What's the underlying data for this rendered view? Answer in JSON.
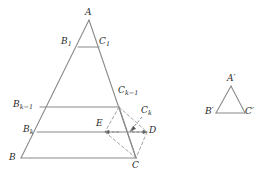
{
  "figure": {
    "background_color": "#ffffff",
    "line_color": "#8a8a8a",
    "dash_color": "#9a9a9a",
    "label_color": "#2b2b2b",
    "labels": {
      "A": "A",
      "B": "B",
      "C": "C",
      "B1_base": "B",
      "B1_sub": "1",
      "C1_base": "C",
      "C1_sub": "1",
      "Bk1_base": "B",
      "Bk1_sub": "k−1",
      "Ck1_base": "C",
      "Ck1_sub": "k−1",
      "Bk_base": "B",
      "Bk_sub": "k",
      "Ck_base": "C",
      "Ck_sub": "k",
      "D": "D",
      "E": "E",
      "Ap": "A′",
      "Bp": "B′",
      "Cp": "C′"
    },
    "points": {
      "A": {
        "x": 89,
        "y": 20
      },
      "B": {
        "x": 21,
        "y": 158
      },
      "C": {
        "x": 136,
        "y": 158
      },
      "B1": {
        "x": 78,
        "y": 47
      },
      "C1": {
        "x": 99,
        "y": 47
      },
      "Bk1": {
        "x": 40,
        "y": 107
      },
      "Ck1": {
        "x": 119,
        "y": 107
      },
      "Bk": {
        "x": 37,
        "y": 132
      },
      "Ck": {
        "x": 130,
        "y": 132
      },
      "E": {
        "x": 105,
        "y": 132
      },
      "D": {
        "x": 147,
        "y": 132
      },
      "Ap": {
        "x": 231,
        "y": 86
      },
      "Bp": {
        "x": 216,
        "y": 113
      },
      "Cp": {
        "x": 245,
        "y": 113
      }
    },
    "solid_segments": [
      {
        "name": "side-AB",
        "from": "A",
        "to": "B"
      },
      {
        "name": "side-AC",
        "from": "A",
        "to": "C"
      },
      {
        "name": "base-BC",
        "from": "B",
        "to": "C"
      },
      {
        "name": "line-B1C1",
        "from": "B1",
        "to": "C1"
      },
      {
        "name": "line-Bk1Ck1",
        "from": "Bk1",
        "to": "Ck1"
      },
      {
        "name": "line-BkD",
        "from": "Bk",
        "to": "D"
      },
      {
        "name": "seg-Ck1C",
        "from": "Ck1",
        "to": "C"
      }
    ],
    "dashed_segments": [
      {
        "name": "dash-Ck1E",
        "from": "Ck1",
        "to": "E"
      },
      {
        "name": "dash-Ck1D",
        "from": "Ck1",
        "to": "D"
      },
      {
        "name": "dash-EC",
        "from": "E",
        "to": "C"
      },
      {
        "name": "dash-DC",
        "from": "D",
        "to": "C"
      }
    ],
    "arrows": [
      {
        "name": "arrow-to-Ck",
        "from": {
          "x": 141,
          "y": 118
        },
        "to": {
          "x": 130,
          "y": 131
        }
      },
      {
        "name": "arrow-to-D",
        "from": {
          "x": 133,
          "y": 132
        },
        "to": {
          "x": 146,
          "y": 132
        }
      },
      {
        "name": "arrow-to-E",
        "from": {
          "x": 118,
          "y": 132
        },
        "to": {
          "x": 106,
          "y": 132
        }
      }
    ],
    "small_triangle_segments": [
      {
        "name": "side-ApBp",
        "from": "Ap",
        "to": "Bp"
      },
      {
        "name": "side-ApCp",
        "from": "Ap",
        "to": "Cp"
      },
      {
        "name": "base-BpCp",
        "from": "Bp",
        "to": "Cp"
      }
    ]
  }
}
